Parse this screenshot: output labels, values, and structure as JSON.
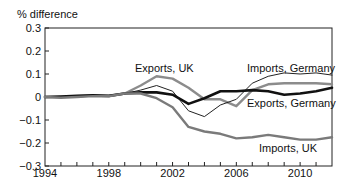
{
  "chart_data": {
    "type": "line",
    "title": "",
    "xlabel": "",
    "ylabel": "% difference",
    "xlim": [
      1994,
      2012
    ],
    "ylim": [
      -0.3,
      0.3
    ],
    "x_ticks": [
      1994,
      1998,
      2002,
      2006,
      2010
    ],
    "x_tick_labels": [
      "1994",
      "1998",
      "2002",
      "2006",
      "2010"
    ],
    "y_ticks": [
      -0.3,
      -0.2,
      -0.1,
      0,
      0.1,
      0.2,
      0.3
    ],
    "y_tick_labels": [
      "−0.3",
      "−0.2",
      "−0.1",
      "0",
      "0.1",
      "0.2",
      "0.3"
    ],
    "grid": false,
    "legend": "inline labels",
    "x": [
      1994,
      1995,
      1996,
      1997,
      1998,
      1999,
      2000,
      2001,
      2002,
      2003,
      2004,
      2005,
      2006,
      2007,
      2008,
      2009,
      2010,
      2011,
      2012
    ],
    "series": [
      {
        "name": "Exports, UK",
        "color": "#8c8c8c",
        "width": 2.4,
        "label_pos": [
          135,
          72
        ],
        "values": [
          0,
          0,
          0.003,
          0.006,
          0.005,
          0.015,
          0.05,
          0.09,
          0.08,
          0.04,
          -0.01,
          -0.01,
          -0.04,
          0.03,
          0.055,
          0.06,
          0.06,
          0.06,
          0.055
        ]
      },
      {
        "name": "Imports, Germany",
        "color": "#222222",
        "width": 1.0,
        "label_pos": [
          247,
          72
        ],
        "values": [
          0,
          0,
          0.003,
          0.006,
          0.005,
          0.015,
          0.03,
          0.05,
          0.025,
          -0.06,
          -0.085,
          -0.035,
          -0.01,
          0.06,
          0.09,
          0.105,
          0.1,
          0.105,
          0.095
        ]
      },
      {
        "name": "Exports, Germany",
        "color": "#111111",
        "width": 2.6,
        "label_pos": [
          247,
          107
        ],
        "values": [
          0,
          0.002,
          0.005,
          0.007,
          0.005,
          0.015,
          0.02,
          0.02,
          0.01,
          -0.03,
          -0.005,
          0.025,
          0.025,
          0.03,
          0.025,
          0.01,
          0.015,
          0.025,
          0.04
        ]
      },
      {
        "name": "Imports, UK",
        "color": "#7a7a7a",
        "width": 2.4,
        "label_pos": [
          259,
          152
        ],
        "values": [
          0,
          -0.003,
          0,
          0.004,
          0.003,
          0.015,
          0.015,
          -0.005,
          -0.045,
          -0.13,
          -0.15,
          -0.16,
          -0.18,
          -0.175,
          -0.165,
          -0.175,
          -0.185,
          -0.185,
          -0.175
        ]
      }
    ]
  }
}
